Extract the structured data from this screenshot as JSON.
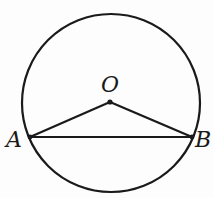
{
  "diagram": {
    "type": "geometry",
    "colors": {
      "stroke": "#1a1a1a",
      "background": "#fdfdfd"
    },
    "circle": {
      "center": "O",
      "cx": 111,
      "cy": 103,
      "r": 89
    },
    "points": [
      {
        "id": "O",
        "label": "O",
        "x": 110,
        "y": 102,
        "label_x": 110,
        "label_y": 92
      },
      {
        "id": "A",
        "label": "A",
        "x": 30,
        "y": 137,
        "label_x": 14,
        "label_y": 147
      },
      {
        "id": "B",
        "label": "B",
        "x": 192,
        "y": 137,
        "label_x": 203,
        "label_y": 147
      }
    ],
    "segments": [
      {
        "from": "O",
        "to": "A"
      },
      {
        "from": "O",
        "to": "B"
      },
      {
        "from": "A",
        "to": "B"
      }
    ]
  }
}
